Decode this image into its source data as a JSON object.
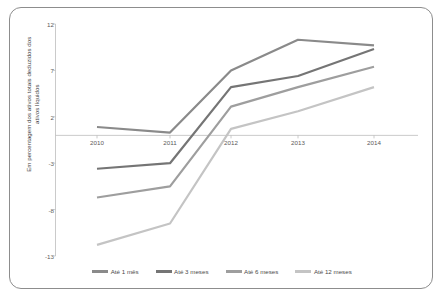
{
  "figure": {
    "frame": true,
    "background": "#ffffff"
  },
  "chart_data": {
    "type": "line",
    "title": "",
    "subtitle": "",
    "xlabel": "",
    "ylabel": "Em percentagem dos ativos totais deduzidos dos ativos líquidos",
    "categories": [
      "2010",
      "2011",
      "2012",
      "2013",
      "2014"
    ],
    "x_tick_labels": [
      "2010",
      "2011",
      "2012",
      "2013",
      "2014"
    ],
    "y_tick_labels": [
      "12",
      "7",
      "2",
      "-3",
      "-8",
      "-13"
    ],
    "y_tick_values": [
      12,
      7,
      2,
      -3,
      -8,
      -13
    ],
    "ylim": [
      -13,
      12
    ],
    "grid": false,
    "zero_line": true,
    "legend_position": "bottom",
    "series": [
      {
        "name": "Até 1 mês",
        "color": "#8a8a8a",
        "values": [
          0.9,
          0.3,
          7.0,
          10.3,
          9.7
        ]
      },
      {
        "name": "Até 3 meses",
        "color": "#757575",
        "values": [
          -3.6,
          -3.0,
          5.2,
          6.4,
          9.3
        ]
      },
      {
        "name": "Até 6 meses",
        "color": "#9e9e9e",
        "values": [
          -6.7,
          -5.5,
          3.1,
          5.2,
          7.4
        ]
      },
      {
        "name": "Até 12 meses",
        "color": "#c4c4c4",
        "values": [
          -11.8,
          -9.5,
          0.7,
          2.6,
          5.2
        ]
      }
    ],
    "axis_color": "#bdbdbd",
    "tick_label_color": "#5a5a5a"
  },
  "legend": {
    "items": [
      {
        "label": "Até 1 mês",
        "color": "#8a8a8a"
      },
      {
        "label": "Até 3 meses",
        "color": "#757575"
      },
      {
        "label": "Até 6 meses",
        "color": "#9e9e9e"
      },
      {
        "label": "Até 12 meses",
        "color": "#c4c4c4"
      }
    ]
  }
}
